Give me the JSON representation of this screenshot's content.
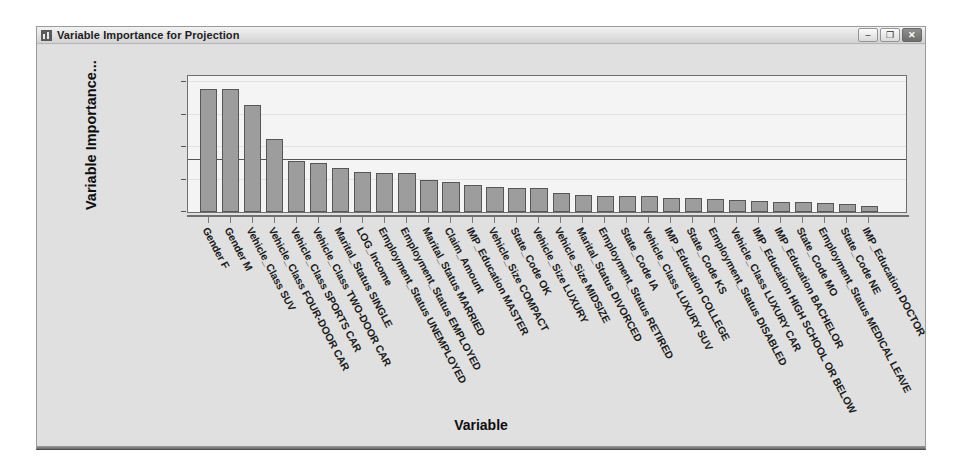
{
  "window": {
    "title": "Variable Importance for Projection",
    "icon": "chart-bar-icon",
    "buttons": {
      "minimize": "–",
      "maximize": "❐",
      "close": "✕"
    }
  },
  "chart_data": {
    "type": "bar",
    "title": "Variable Importance for Projection",
    "xlabel": "Variable",
    "ylabel": "Variable Importance...",
    "ylabel_full": "Variable Importance for Projection",
    "ylim": [
      0.0,
      2.1
    ],
    "yticks": [
      "0.0",
      "0.5",
      "1.0",
      "1.5",
      "2.0"
    ],
    "ytick_values": [
      0.0,
      0.5,
      1.0,
      1.5,
      2.0
    ],
    "grid": true,
    "legend": "none",
    "reference_line": 0.8,
    "bar_color": "#9d9d9d",
    "bar_edge_color": "#575757",
    "plot_background": "#f4f4f4",
    "categories": [
      "Gender F",
      "Gender M",
      "Vehicle_Class SUV",
      "Vehicle_Class FOUR-DOOR CAR",
      "Vehicle_Class SPORTS CAR",
      "Vehicle_Class TWO-DOOR CAR",
      "Marital_Status SINGLE",
      "LOG_Income",
      "Employment_Status UNEMPLOYED",
      "Employment_Status EMPLOYED",
      "Marital_Status MARRIED",
      "Claim_Amount",
      "IMP_Education MASTER",
      "Vehicle_Size COMPACT",
      "State_Code OK",
      "Vehicle_Size LUXURY",
      "Vehicle_Size MIDSIZE",
      "Marital_Status DIVORCED",
      "Employment_Status RETIRED",
      "State_Code IA",
      "Vehicle_Class LUXURY SUV",
      "IMP_Education COLLEGE",
      "State_Code KS",
      "Employment_Status DISABLED",
      "Vehicle_Class LUXURY CAR",
      "IMP_Education HIGH SCHOOL OR BELOW",
      "IMP_Education BACHELOR",
      "State_Code MO",
      "Employment_Status MEDICAL LEAVE",
      "State_Code NE",
      "IMP_Education DOCTOR"
    ],
    "values": [
      1.9,
      1.9,
      1.66,
      1.13,
      0.79,
      0.76,
      0.68,
      0.62,
      0.61,
      0.61,
      0.49,
      0.47,
      0.41,
      0.39,
      0.37,
      0.37,
      0.29,
      0.26,
      0.25,
      0.24,
      0.24,
      0.22,
      0.21,
      0.2,
      0.19,
      0.17,
      0.16,
      0.15,
      0.14,
      0.12,
      0.1
    ]
  }
}
